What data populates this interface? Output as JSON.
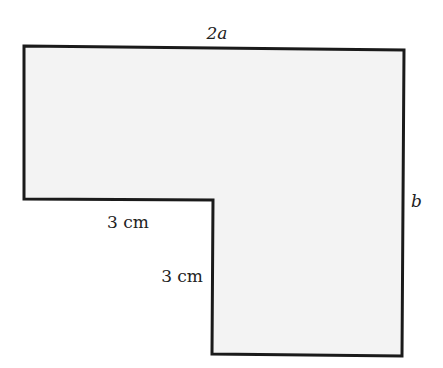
{
  "diagram": {
    "shape": "L-shaped polygon",
    "fill_color": "#f3f3f3",
    "stroke_color": "#1a1a1a",
    "labels": {
      "top": "2a",
      "right": "b",
      "inner_horizontal": "3 cm",
      "inner_vertical": "3 cm"
    }
  }
}
